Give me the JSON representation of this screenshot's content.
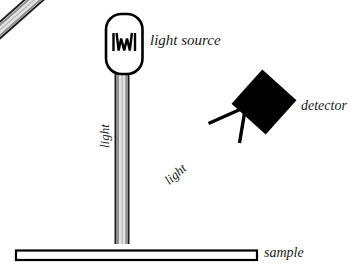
{
  "diagram": {
    "background_color": "#ffffff",
    "ink_color": "#000000",
    "beam_core_color": "#9a9a9a",
    "beam_inner_color": "#cfcfcf"
  },
  "labels": {
    "light_source": "light source",
    "detector": "detector",
    "sample": "sample",
    "light_incident": "light",
    "light_reflected": "light"
  },
  "components": {
    "lamp": {
      "name": "light-source-lamp",
      "shape": "rounded-rectangle",
      "filament_glyph": "zigzag-filament"
    },
    "detector": {
      "name": "detector-block",
      "shape": "rotated-square",
      "fill": "#000000",
      "rotation_deg": 42
    },
    "sample": {
      "name": "sample-substrate",
      "shape": "thin-rectangle",
      "fill": "#ffffff",
      "stroke": "#000000"
    },
    "incident_beam": {
      "name": "incident-beam",
      "direction": "vertical-downward"
    },
    "reflected_beam": {
      "name": "reflected-beam",
      "direction": "diagonal-upward-right",
      "arrowhead": "open-chevron"
    }
  }
}
